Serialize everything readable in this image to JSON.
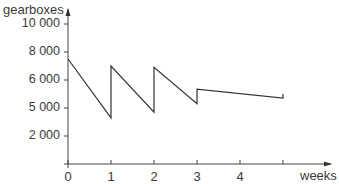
{
  "chart_data": {
    "type": "line",
    "title": "",
    "xlabel": "weeks",
    "ylabel": "gearboxes",
    "x_ticks": [
      0,
      1,
      2,
      3,
      4,
      5
    ],
    "x_tick_labels": [
      "0",
      "1",
      "2",
      "3",
      "4",
      ""
    ],
    "y_ticks": [
      2000,
      4000,
      6000,
      8000,
      10000
    ],
    "y_tick_labels": [
      "2 000",
      "5 000",
      "6 000",
      "8 000",
      "10 000"
    ],
    "xlim": [
      0,
      5.7
    ],
    "ylim": [
      0,
      11700
    ],
    "grid": false,
    "legend": null,
    "series": [
      {
        "name": "stock level",
        "x": [
          0,
          1,
          1,
          2,
          2,
          3,
          3,
          5,
          5
        ],
        "y": [
          7500,
          3300,
          7000,
          3700,
          6900,
          4300,
          5350,
          4700,
          5000
        ]
      }
    ]
  },
  "axes": {
    "y_label": "gearboxes",
    "x_label": "weeks"
  },
  "colors": {
    "line": "#333333",
    "axis": "#444444",
    "text": "#3a3a3a"
  }
}
